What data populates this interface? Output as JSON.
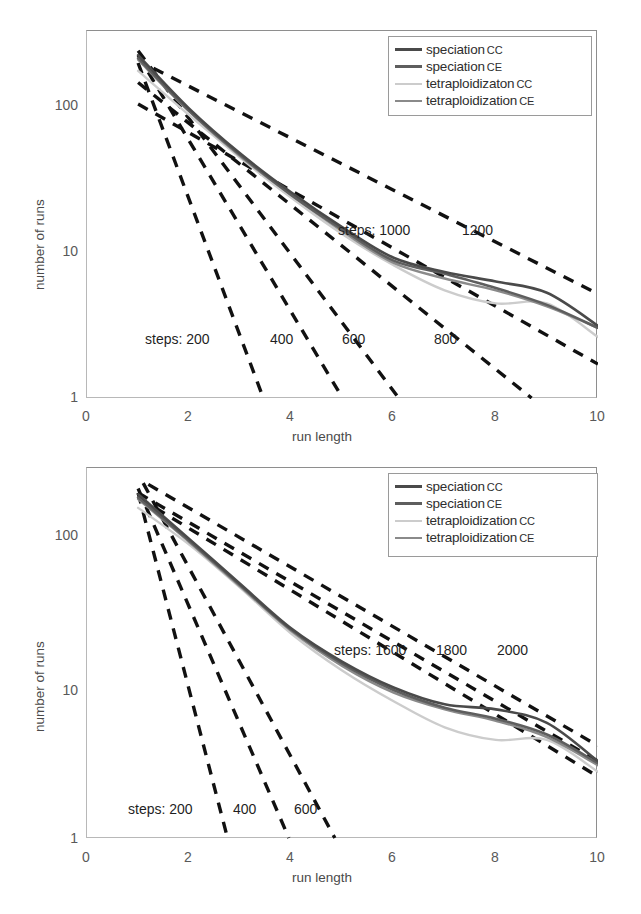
{
  "figure": {
    "panels": [
      {
        "id": "top",
        "legend": [
          {
            "label": "speciation",
            "sub": "CC",
            "color": "#4a4a4a",
            "width": 3.2
          },
          {
            "label": "speciation",
            "sub": "CE",
            "color": "#5e5e5e",
            "width": 3.2
          },
          {
            "label": "tetraploidizaton",
            "sub": "CC",
            "color": "#cccccc",
            "width": 2.2
          },
          {
            "label": "tetraploidization",
            "sub": "CE",
            "color": "#8a8a8a",
            "width": 2.4
          }
        ],
        "annotations": [
          {
            "text": "steps:  200",
            "x": 0.13,
            "y": 0.785
          },
          {
            "text": "400",
            "x": 0.375,
            "y": 0.785
          },
          {
            "text": "600",
            "x": 0.515,
            "y": 0.785
          },
          {
            "text": "800",
            "x": 0.695,
            "y": 0.785
          },
          {
            "text": "steps:  1000",
            "x": 0.505,
            "y": 0.54
          },
          {
            "text": "1200",
            "x": 0.755,
            "y": 0.54
          }
        ]
      },
      {
        "id": "bottom",
        "legend": [
          {
            "label": "speciation",
            "sub": "CC",
            "color": "#4a4a4a",
            "width": 3.2
          },
          {
            "label": "speciation",
            "sub": "CE",
            "color": "#5e5e5e",
            "width": 3.2
          },
          {
            "label": "tetraploidization",
            "sub": "CC",
            "color": "#cccccc",
            "width": 2.2
          },
          {
            "label": "tetraploidization",
            "sub": "CE",
            "color": "#8a8a8a",
            "width": 2.4
          }
        ],
        "annotations": [
          {
            "text": "steps:  200",
            "x": 0.095,
            "y": 0.855
          },
          {
            "text": "400",
            "x": 0.305,
            "y": 0.855
          },
          {
            "text": "600",
            "x": 0.425,
            "y": 0.855
          },
          {
            "text": "steps:  1600",
            "x": 0.5,
            "y": 0.49
          },
          {
            "text": "1800",
            "x": 0.7,
            "y": 0.49
          },
          {
            "text": "2000",
            "x": 0.8,
            "y": 0.49
          }
        ]
      }
    ]
  },
  "chart_data": [
    {
      "type": "line",
      "panel": "top",
      "title": "",
      "xlabel": "run length",
      "ylabel": "number of runs",
      "xlim": [
        0,
        10
      ],
      "ylim": [
        1,
        300
      ],
      "yscale": "log",
      "xticks": [
        0,
        2,
        4,
        6,
        8,
        10
      ],
      "yticks": [
        1,
        10,
        100
      ],
      "grid": false,
      "legend_position": "top-right",
      "x": [
        1,
        2,
        3,
        4,
        5,
        6,
        7,
        8,
        9,
        10
      ],
      "series": [
        {
          "name": "speciation CC",
          "style": "solid",
          "color": "#4a4a4a",
          "values": [
            215,
            93,
            46,
            25,
            14.5,
            9.0,
            7.2,
            6.2,
            5.2,
            3.1
          ]
        },
        {
          "name": "speciation CE",
          "style": "solid",
          "color": "#5e5e5e",
          "values": [
            205,
            90,
            45,
            24,
            14.0,
            8.6,
            7.0,
            5.6,
            4.3,
            3.0
          ]
        },
        {
          "name": "tetraploidizaton CC",
          "style": "solid",
          "color": "#cccccc",
          "values": [
            168,
            84,
            43,
            23,
            13.0,
            8.0,
            5.4,
            4.4,
            4.4,
            2.6
          ]
        },
        {
          "name": "tetraploidization CE",
          "style": "solid",
          "color": "#8a8a8a",
          "values": [
            200,
            89,
            44,
            24,
            13.6,
            8.3,
            6.5,
            5.4,
            4.2,
            3.0
          ]
        }
      ],
      "reference_lines": [
        {
          "label": "steps: 200",
          "style": "dashed",
          "color": "#111111",
          "x0": 1.0,
          "y0": 190,
          "x1": 3.45,
          "y1": 1.0
        },
        {
          "label": "steps: 400",
          "style": "dashed",
          "color": "#111111",
          "x0": 1.0,
          "y0": 215,
          "x1": 5.0,
          "y1": 1.0
        },
        {
          "label": "steps: 600",
          "style": "dashed",
          "color": "#111111",
          "x0": 1.0,
          "y0": 230,
          "x1": 6.1,
          "y1": 1.0
        },
        {
          "label": "steps: 800",
          "style": "dashed",
          "color": "#111111",
          "x0": 1.0,
          "y0": 140,
          "x1": 8.7,
          "y1": 1.0
        },
        {
          "label": "steps: 1000",
          "style": "dashed",
          "color": "#111111",
          "x0": 1.0,
          "y0": 100,
          "x1": 10.0,
          "y1": 1.7
        },
        {
          "label": "steps: 1200",
          "style": "dashed",
          "color": "#111111",
          "x0": 1.3,
          "y0": 175,
          "x1": 10.0,
          "y1": 5.1
        }
      ]
    },
    {
      "type": "line",
      "panel": "bottom",
      "title": "",
      "xlabel": "run length",
      "ylabel": "number of runs",
      "xlim": [
        0,
        10
      ],
      "ylim": [
        1,
        300
      ],
      "yscale": "log",
      "xticks": [
        0,
        2,
        4,
        6,
        8,
        10
      ],
      "yticks": [
        1,
        10,
        100
      ],
      "grid": false,
      "legend_position": "top-right",
      "x": [
        1,
        2,
        3,
        4,
        5,
        6,
        7,
        8,
        9,
        10
      ],
      "series": [
        {
          "name": "speciation CC",
          "style": "solid",
          "color": "#4a4a4a",
          "values": [
            210,
            105,
            52,
            26,
            15.5,
            10.4,
            8.0,
            7.4,
            6.0,
            3.3
          ]
        },
        {
          "name": "speciation CE",
          "style": "solid",
          "color": "#5e5e5e",
          "values": [
            200,
            102,
            51,
            25.5,
            15.0,
            10.0,
            7.6,
            6.4,
            5.0,
            3.2
          ]
        },
        {
          "name": "tetraploidization CC",
          "style": "solid",
          "color": "#cccccc",
          "values": [
            170,
            96,
            49,
            24,
            13.5,
            8.4,
            5.6,
            4.6,
            4.6,
            2.8
          ]
        },
        {
          "name": "tetraploidization CE",
          "style": "solid",
          "color": "#8a8a8a",
          "values": [
            195,
            100,
            50,
            25,
            14.5,
            9.6,
            7.4,
            6.2,
            4.8,
            3.1
          ]
        }
      ],
      "reference_lines": [
        {
          "label": "steps: 200",
          "style": "dashed",
          "color": "#111111",
          "x0": 1.0,
          "y0": 215,
          "x1": 2.75,
          "y1": 1.0
        },
        {
          "label": "steps: 400",
          "style": "dashed",
          "color": "#111111",
          "x0": 1.0,
          "y0": 230,
          "x1": 3.95,
          "y1": 1.0
        },
        {
          "label": "steps: 600",
          "style": "dashed",
          "color": "#111111",
          "x0": 1.1,
          "y0": 250,
          "x1": 4.85,
          "y1": 1.0
        },
        {
          "label": "steps: 1600",
          "style": "dashed",
          "color": "#111111",
          "x0": 1.0,
          "y0": 200,
          "x1": 10.0,
          "y1": 2.6
        },
        {
          "label": "steps: 1800",
          "style": "dashed",
          "color": "#111111",
          "x0": 1.0,
          "y0": 215,
          "x1": 10.0,
          "y1": 3.3
        },
        {
          "label": "steps: 2000",
          "style": "dashed",
          "color": "#111111",
          "x0": 1.2,
          "y0": 245,
          "x1": 10.0,
          "y1": 4.2
        }
      ]
    }
  ]
}
